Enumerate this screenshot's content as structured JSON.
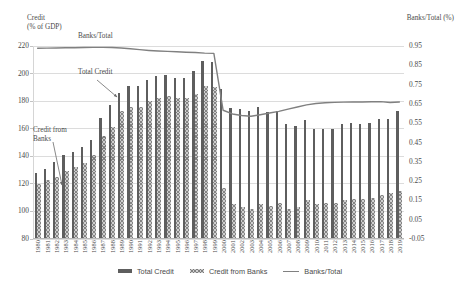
{
  "chart_data": {
    "type": "bar",
    "title": "",
    "xlabel": "",
    "ylabel": "Credit\n(% of GDP)",
    "y2label": "Banks/Total (%)",
    "ylim": [
      80,
      220
    ],
    "y2lim": [
      -0.05,
      0.95
    ],
    "yticks": [
      80,
      100,
      120,
      140,
      160,
      180,
      200,
      220
    ],
    "y2ticks": [
      -0.05,
      0.05,
      0.15,
      0.25,
      0.35,
      0.45,
      0.55,
      0.65,
      0.75,
      0.85,
      0.95
    ],
    "grid": true,
    "legend_position": "bottom",
    "categories": [
      "1980",
      "1981",
      "1982",
      "1983",
      "1984",
      "1985",
      "1986",
      "1987",
      "1988",
      "1989",
      "1990",
      "1991",
      "1992",
      "1993",
      "1994",
      "1995",
      "1996",
      "1997",
      "1998",
      "1999",
      "2000",
      "2001",
      "2002",
      "2003",
      "2004",
      "2005",
      "2006",
      "2007",
      "2008",
      "2009",
      "2010",
      "2011",
      "2012",
      "2013",
      "2014",
      "2015",
      "2016",
      "2017",
      "2018",
      "2019"
    ],
    "series": [
      {
        "name": "Total Credit",
        "axis": "left",
        "type": "bar",
        "color": "#5e5e5e",
        "values": [
          127,
          130,
          135,
          140,
          142,
          146,
          151,
          167,
          176,
          185,
          190,
          190,
          194,
          197,
          198,
          196,
          196,
          201,
          208,
          207,
          188,
          174,
          173,
          172,
          175,
          171,
          172,
          162,
          161,
          165,
          159,
          159,
          159,
          162,
          163,
          162,
          163,
          166,
          166,
          172
        ]
      },
      {
        "name": "Credit from Banks",
        "axis": "left",
        "type": "bar",
        "color": "#cfcfcf",
        "values": [
          119,
          122,
          124,
          128,
          131,
          134,
          140,
          154,
          160,
          172,
          175,
          175,
          179,
          181,
          183,
          181,
          181,
          184,
          190,
          189,
          116,
          104,
          102,
          101,
          104,
          103,
          105,
          101,
          102,
          107,
          104,
          105,
          105,
          107,
          108,
          108,
          109,
          111,
          112,
          114
        ]
      },
      {
        "name": "Banks/Total",
        "axis": "right",
        "type": "line",
        "color": "#808080",
        "values": [
          0.938,
          0.939,
          0.94,
          0.941,
          0.941,
          0.942,
          0.943,
          0.943,
          0.942,
          0.94,
          0.936,
          0.931,
          0.927,
          0.924,
          0.922,
          0.92,
          0.918,
          0.916,
          0.913,
          0.912,
          0.617,
          0.598,
          0.59,
          0.586,
          0.594,
          0.603,
          0.611,
          0.623,
          0.634,
          0.645,
          0.652,
          0.656,
          0.658,
          0.659,
          0.66,
          0.66,
          0.661,
          0.662,
          0.657,
          0.66
        ]
      }
    ],
    "annotations": [
      {
        "name": "banks-total",
        "text": "Banks/Total"
      },
      {
        "name": "total-credit",
        "text": "Total Credit"
      },
      {
        "name": "credit-from-banks",
        "text": "Credit from\nBanks"
      }
    ]
  },
  "legend": {
    "items": [
      {
        "label": "Total Credit"
      },
      {
        "label": "Credit from Banks"
      },
      {
        "label": "Banks/Total"
      }
    ]
  }
}
